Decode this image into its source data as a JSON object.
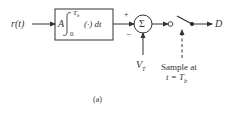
{
  "diagram": {
    "input_label": "r(t)",
    "integrator": {
      "gain": "A",
      "upper_limit": "T",
      "upper_limit_sub": "b",
      "lower_limit": "0",
      "integrand": "(·) dt"
    },
    "summer": {
      "symbol": "Σ",
      "plus_sign": "+",
      "minus_sign": "−"
    },
    "threshold_label": "V",
    "threshold_sub": "T",
    "sampler_label_line1": "Sample at",
    "sampler_label_line2_prefix": "t = T",
    "sampler_label_line2_sub": "b",
    "output_label": "D",
    "caption": "(a)"
  }
}
